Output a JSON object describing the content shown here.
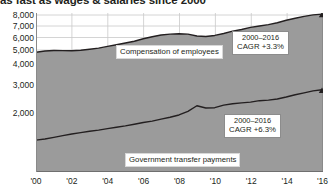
{
  "title": "as fast as wages & salaries since 2000",
  "chart_data": {
    "type": "area",
    "title": "as fast as wages & salaries since 2000",
    "xlabel": "",
    "ylabel": "",
    "grid": true,
    "legend_position": "in-plot labels",
    "yscale": "compressed (non-uniform tick spacing)",
    "ytick_labels": [
      "8,000",
      "7,000",
      "6,000",
      "5,000",
      "4,000",
      "3,000",
      "2,000"
    ],
    "ytick_values": [
      8000,
      7000,
      6000,
      5000,
      4000,
      3000,
      2000
    ],
    "xtick_labels": [
      "'00",
      "'02",
      "'04",
      "'06",
      "'08",
      "'10",
      "'12",
      "'14",
      "'16"
    ],
    "xtick_values": [
      2000,
      2002,
      2004,
      2006,
      2008,
      2010,
      2012,
      2014,
      2016
    ],
    "xlim": [
      2000,
      2016
    ],
    "x": [
      2000,
      2000.5,
      2001,
      2001.5,
      2002,
      2002.5,
      2003,
      2003.5,
      2004,
      2004.5,
      2005,
      2005.5,
      2006,
      2006.5,
      2007,
      2007.5,
      2008,
      2008.5,
      2009,
      2009.5,
      2010,
      2010.5,
      2011,
      2011.5,
      2012,
      2012.5,
      2013,
      2013.5,
      2014,
      2014.5,
      2015,
      2015.5,
      2016
    ],
    "series": [
      {
        "name": "Compensation of employees",
        "label": "Compensation of employees",
        "cagr_period": "2000–2016",
        "cagr_value": "CAGR +3.3%",
        "values": [
          4840,
          4930,
          4960,
          4955,
          4950,
          4980,
          5060,
          5150,
          5290,
          5420,
          5560,
          5700,
          5900,
          6070,
          6220,
          6290,
          6320,
          6290,
          6130,
          6090,
          6180,
          6350,
          6550,
          6700,
          6880,
          7000,
          7120,
          7300,
          7520,
          7700,
          7880,
          8010,
          8080
        ]
      },
      {
        "name": "Government transfer payments",
        "label": "Government transfer payments",
        "cagr_period": "2000–2016",
        "cagr_value": "CAGR +6.3%",
        "values": [
          1030,
          1070,
          1130,
          1190,
          1250,
          1300,
          1350,
          1390,
          1440,
          1490,
          1540,
          1600,
          1660,
          1710,
          1780,
          1850,
          1930,
          2060,
          2260,
          2180,
          2190,
          2280,
          2330,
          2360,
          2390,
          2440,
          2460,
          2500,
          2570,
          2650,
          2720,
          2790,
          2830
        ]
      }
    ],
    "annotations": [
      {
        "text": "Compensation of employees",
        "kind": "series-label"
      },
      {
        "text": "Government transfer payments",
        "kind": "series-label"
      },
      {
        "text": "2000–2016 CAGR +3.3%",
        "kind": "callout"
      },
      {
        "text": "2000–2016 CAGR +6.3%",
        "kind": "callout"
      }
    ],
    "colors": {
      "area_fill": "#9b9b9b",
      "line": "#231f20",
      "grid": "#c9c9c9",
      "axis": "#6f6f6f",
      "text": "#231f20",
      "background": "#ffffff"
    }
  }
}
